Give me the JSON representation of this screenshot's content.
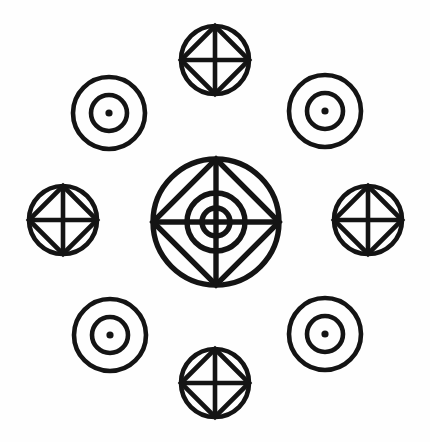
{
  "figure": {
    "canvas": {
      "width": 430,
      "height": 442,
      "background": "#fefefe"
    },
    "ink_color": "#141414",
    "stroke_width": 4.6,
    "center": {
      "x": 216,
      "y": 222
    },
    "symbol_types": {
      "wheel": "circle-with-inscribed-square-and-cross",
      "dot": "concentric-circles-with-center-dot",
      "target": "circle-with-inscribed-square-cross-and-concentric-rings"
    },
    "elements": [
      {
        "id": "center-target",
        "name": "center-target-symbol",
        "type": "target",
        "position": "center",
        "cx": 216,
        "cy": 222,
        "outer_radius": 63,
        "square_half": 63,
        "rings": [
          29,
          14
        ],
        "stroke_width": 5.4
      },
      {
        "id": "wheel-top",
        "name": "wheel-symbol-top",
        "type": "wheel",
        "position": "top",
        "cx": 215,
        "cy": 60,
        "outer_radius": 34,
        "stroke_width": 4.6
      },
      {
        "id": "wheel-right",
        "name": "wheel-symbol-right",
        "type": "wheel",
        "position": "right",
        "cx": 368,
        "cy": 220,
        "outer_radius": 34,
        "stroke_width": 4.6
      },
      {
        "id": "wheel-bottom",
        "name": "wheel-symbol-bottom",
        "type": "wheel",
        "position": "bottom",
        "cx": 215,
        "cy": 383,
        "outer_radius": 34,
        "stroke_width": 4.6
      },
      {
        "id": "wheel-left",
        "name": "wheel-symbol-left",
        "type": "wheel",
        "position": "left",
        "cx": 63,
        "cy": 220,
        "outer_radius": 34,
        "stroke_width": 4.6
      },
      {
        "id": "dot-top-left",
        "name": "dot-symbol-top-left",
        "type": "dot",
        "position": "top-left",
        "cx": 109,
        "cy": 113,
        "outer_radius": 36,
        "inner_radius": 18,
        "dot_radius": 3.6,
        "stroke_width": 4.6
      },
      {
        "id": "dot-top-right",
        "name": "dot-symbol-top-right",
        "type": "dot",
        "position": "top-right",
        "cx": 325,
        "cy": 111,
        "outer_radius": 36,
        "inner_radius": 18,
        "dot_radius": 3.6,
        "stroke_width": 4.6
      },
      {
        "id": "dot-bottom-left",
        "name": "dot-symbol-bottom-left",
        "type": "dot",
        "position": "bottom-left",
        "cx": 110,
        "cy": 335,
        "outer_radius": 36,
        "inner_radius": 18,
        "dot_radius": 3.6,
        "stroke_width": 4.6
      },
      {
        "id": "dot-bottom-right",
        "name": "dot-symbol-bottom-right",
        "type": "dot",
        "position": "bottom-right",
        "cx": 325,
        "cy": 334,
        "outer_radius": 36,
        "inner_radius": 18,
        "dot_radius": 3.6,
        "stroke_width": 4.6
      }
    ]
  }
}
